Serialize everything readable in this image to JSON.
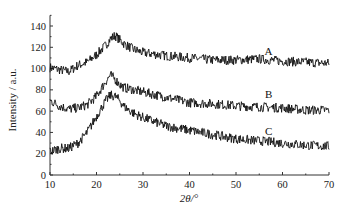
{
  "chart_data": {
    "type": "line",
    "title": "",
    "xlabel": "2θ/°",
    "ylabel": "Intensity / a.u.",
    "xlim": [
      10,
      70
    ],
    "ylim": [
      0,
      150
    ],
    "xticks": [
      10,
      20,
      30,
      40,
      50,
      60,
      70
    ],
    "yticks": [
      0,
      20,
      40,
      60,
      80,
      100,
      120,
      140
    ],
    "grid": false,
    "legend": "inline labels at right",
    "x": [
      10,
      12,
      14,
      16,
      18,
      20,
      22,
      23,
      24,
      25,
      26,
      28,
      30,
      35,
      40,
      45,
      50,
      55,
      60,
      65,
      70
    ],
    "series": [
      {
        "name": "A",
        "values": [
          101,
          99,
          97,
          103,
          106,
          113,
          122,
          128,
          131,
          127,
          123,
          118,
          115,
          112,
          110,
          108,
          108,
          109,
          107,
          106,
          105
        ]
      },
      {
        "name": "B",
        "values": [
          70,
          65,
          62,
          63,
          66,
          74,
          88,
          94,
          90,
          85,
          82,
          80,
          78,
          73,
          68,
          67,
          65,
          64,
          63,
          61,
          61
        ]
      },
      {
        "name": "C",
        "values": [
          22,
          25,
          25,
          30,
          40,
          55,
          70,
          75,
          74,
          70,
          64,
          58,
          54,
          46,
          42,
          38,
          34,
          32,
          30,
          28,
          27
        ]
      }
    ],
    "annotations": [
      {
        "text": "A",
        "x": 57,
        "y": 113
      },
      {
        "text": "B",
        "x": 57,
        "y": 72
      },
      {
        "text": "C",
        "x": 57,
        "y": 38
      }
    ]
  }
}
